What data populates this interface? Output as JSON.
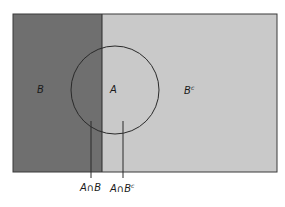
{
  "diagram": {
    "type": "venn",
    "title": "",
    "universe": {
      "x": 13,
      "y": 14,
      "width": 264,
      "height": 158,
      "color_light": "#c9c9c9",
      "color_dark": "#6f6f6f",
      "border_color": "#2a2a2a"
    },
    "set_B": {
      "label": "B",
      "region": "left portion of rectangle",
      "split_x": 102,
      "fill": "#6f6f6f"
    },
    "set_B_complement": {
      "label": "B",
      "superscript": "c",
      "fill": "#c9c9c9"
    },
    "set_A": {
      "label": "A",
      "shape": "circle",
      "cx": 115,
      "cy": 90,
      "r": 44,
      "stroke": "#2a2a2a"
    },
    "callouts": [
      {
        "label": "A∩B",
        "superscript": "",
        "line_x": 91,
        "line_y1": 121,
        "line_y2": 178
      },
      {
        "label": "A∩B",
        "superscript": "c",
        "line_x": 123,
        "line_y1": 121,
        "line_y2": 178
      }
    ]
  }
}
